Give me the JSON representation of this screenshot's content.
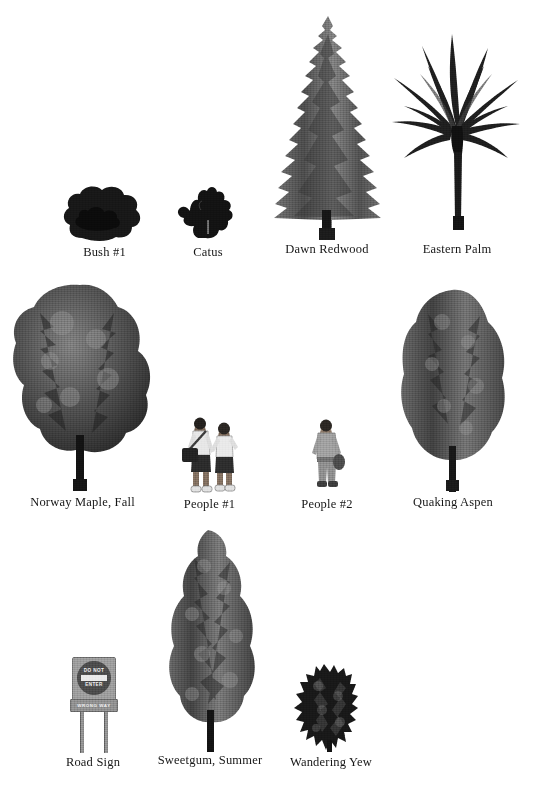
{
  "page": {
    "clipped_header_text": "···  ··  ····  ··  ······  ··  ···",
    "background_color": "#ffffff",
    "ink_color": "#1d1d1d"
  },
  "rows": [
    {
      "row_index": 1,
      "items": [
        {
          "id": "bush-1",
          "label": "Bush #1",
          "kind": "shrub",
          "height_px": 46
        },
        {
          "id": "catus",
          "label": "Catus",
          "kind": "cactus",
          "height_px": 42
        },
        {
          "id": "dawn-redwood",
          "label": "Dawn Redwood",
          "kind": "conifer",
          "height_px": 215
        },
        {
          "id": "eastern-palm",
          "label": "Eastern Palm",
          "kind": "palm",
          "height_px": 205
        }
      ]
    },
    {
      "row_index": 2,
      "items": [
        {
          "id": "norway-maple-fall",
          "label": "Norway Maple, Fall",
          "kind": "broadleaf",
          "height_px": 200
        },
        {
          "id": "people-1",
          "label": "People #1",
          "kind": "people",
          "height_px": 72
        },
        {
          "id": "people-2",
          "label": "People #2",
          "kind": "person",
          "height_px": 68
        },
        {
          "id": "quaking-aspen",
          "label": "Quaking Aspen",
          "kind": "columnar",
          "height_px": 198
        }
      ]
    },
    {
      "row_index": 3,
      "items": [
        {
          "id": "road-sign",
          "label": "Road Sign",
          "kind": "sign",
          "height_px": 88
        },
        {
          "id": "sweetgum-summer",
          "label": "Sweetgum, Summer",
          "kind": "pyramidal",
          "height_px": 215
        },
        {
          "id": "wandering-yew",
          "label": "Wandering Yew",
          "kind": "yew",
          "height_px": 80
        }
      ]
    }
  ],
  "road_sign": {
    "line_1": "DO NOT",
    "line_2": "ENTER",
    "plaque": "WRONG  WAY"
  },
  "colors": {
    "foliage_dark": "#2d2d2d",
    "foliage_mid": "#555555",
    "foliage_light": "#8a8a8a",
    "trunk": "#141414",
    "sign_gray": "#9a9a9a",
    "sign_face": "#4a4a4a"
  }
}
